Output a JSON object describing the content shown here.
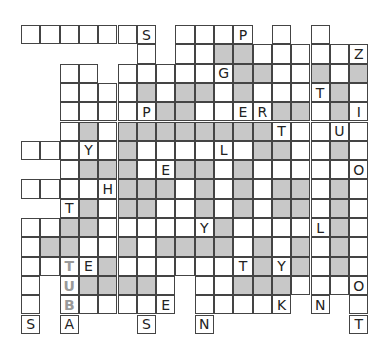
{
  "puzzle": {
    "type": "fill-in crossword grid",
    "columns": 18,
    "rows": 16,
    "cell_size_px": 19.3,
    "colors": {
      "white_cell": "#ffffff",
      "shaded_cell": "#c8c8c8",
      "border": "#444444",
      "letter": "#222222",
      "hint_letter": "#9a9a9a"
    },
    "legend": {
      ".": "no cell",
      "w": "empty white cell",
      "g": "shaded cell",
      "A-Z": "white cell with given letter",
      "lowercase letter t/u/b": "grey hint letter (TUBA example)"
    },
    "grid": [
      "wwwwwwS.wwwP.w.w..",
      "......w.wwggwwwwwZ",
      "..ww.wwwwwGggwwgwg",
      "..wwwwgwggwgwwwTgw",
      "..wwwwPggwwERggwgI",
      "..wgwggggggggTwwUw",
      "wwwYwgwwwwLwggwwgw",
      "..wgggwEggwgwwwwwO",
      "wwwwHgggwgwgwggwgw",
      "..Tgwggwwgwgwggwgw",
      "wwggwwwwwYgwwwwLgw",
      "wggwwgwggggwgwgwgw",
      "wwtEgwwwwwwTgYgwgw",
      "w.uggggw.wwgggwwwO",
      "w.bwwwwE.wwwwK.N.w",
      "S.A...S..N.......T"
    ],
    "given_letters": [
      {
        "row": 0,
        "col": 6,
        "letter": "S"
      },
      {
        "row": 0,
        "col": 11,
        "letter": "P"
      },
      {
        "row": 1,
        "col": 17,
        "letter": "Z"
      },
      {
        "row": 2,
        "col": 10,
        "letter": "G"
      },
      {
        "row": 3,
        "col": 15,
        "letter": "T"
      },
      {
        "row": 4,
        "col": 6,
        "letter": "P"
      },
      {
        "row": 4,
        "col": 11,
        "letter": "E"
      },
      {
        "row": 4,
        "col": 12,
        "letter": "R"
      },
      {
        "row": 4,
        "col": 17,
        "letter": "I"
      },
      {
        "row": 5,
        "col": 13,
        "letter": "T"
      },
      {
        "row": 5,
        "col": 16,
        "letter": "U"
      },
      {
        "row": 6,
        "col": 3,
        "letter": "Y"
      },
      {
        "row": 6,
        "col": 10,
        "letter": "L"
      },
      {
        "row": 7,
        "col": 7,
        "letter": "E"
      },
      {
        "row": 7,
        "col": 17,
        "letter": "O"
      },
      {
        "row": 8,
        "col": 4,
        "letter": "H"
      },
      {
        "row": 9,
        "col": 2,
        "letter": "T"
      },
      {
        "row": 9,
        "col": 15,
        "letter": "H"
      },
      {
        "row": 9,
        "col": 17,
        "letter": "M"
      },
      {
        "row": 10,
        "col": 9,
        "letter": "Y"
      },
      {
        "row": 10,
        "col": 15,
        "letter": "L"
      },
      {
        "row": 12,
        "col": 3,
        "letter": "E"
      },
      {
        "row": 12,
        "col": 11,
        "letter": "T"
      },
      {
        "row": 12,
        "col": 13,
        "letter": "Y"
      },
      {
        "row": 13,
        "col": 17,
        "letter": "O"
      },
      {
        "row": 14,
        "col": 7,
        "letter": "E"
      },
      {
        "row": 14,
        "col": 13,
        "letter": "K"
      },
      {
        "row": 14,
        "col": 15,
        "letter": "N"
      },
      {
        "row": 15,
        "col": 0,
        "letter": "S"
      },
      {
        "row": 15,
        "col": 2,
        "letter": "A"
      },
      {
        "row": 15,
        "col": 6,
        "letter": "S"
      },
      {
        "row": 15,
        "col": 9,
        "letter": "N"
      },
      {
        "row": 15,
        "col": 17,
        "letter": "T"
      }
    ],
    "hint_word": {
      "text": "TUBA",
      "hint_letters": [
        "T",
        "U",
        "B"
      ],
      "col": 2,
      "start_row": 12,
      "direction": "down"
    }
  }
}
